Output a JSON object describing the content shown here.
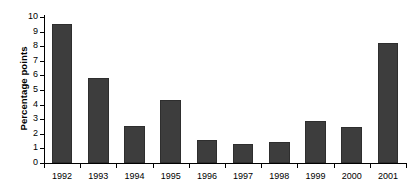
{
  "chart_data": {
    "type": "bar",
    "title": "",
    "xlabel": "",
    "ylabel": "Percentage points",
    "categories": [
      "1992",
      "1993",
      "1994",
      "1995",
      "1996",
      "1997",
      "1998",
      "1999",
      "2000",
      "2001"
    ],
    "values": [
      9.5,
      5.8,
      2.55,
      4.35,
      1.55,
      1.3,
      1.45,
      2.9,
      2.45,
      8.2
    ],
    "ylim": [
      0,
      10
    ],
    "ytick_step": 1,
    "ytick_labels": [
      "0",
      "1",
      "2",
      "3",
      "4",
      "5",
      "6",
      "7",
      "8",
      "9",
      "10"
    ],
    "grid": false,
    "legend": false,
    "bar_color": "#3d3d3d",
    "axis_color": "#000000",
    "background_color": "#ffffff"
  }
}
